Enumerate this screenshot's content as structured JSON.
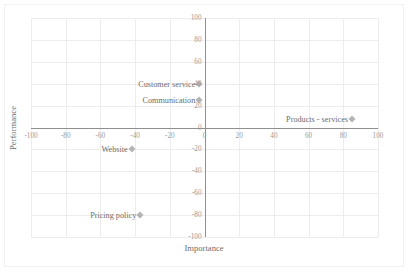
{
  "chart_data": {
    "type": "scatter",
    "title": "",
    "xlabel": "Importance",
    "ylabel": "Performance",
    "xlim": [
      -100,
      100
    ],
    "ylim": [
      -100,
      100
    ],
    "grid": true,
    "legend": "none",
    "xticks": [
      "-100",
      "-80",
      "-60",
      "-40",
      "-20",
      "0",
      "20",
      "40",
      "60",
      "80",
      "100"
    ],
    "xtickvalues": [
      -100,
      -80,
      -60,
      -40,
      -20,
      0,
      20,
      40,
      60,
      80,
      100
    ],
    "yticks": [
      "100",
      "80",
      "60",
      "40",
      "20",
      "0",
      "-20",
      "-40",
      "-60",
      "-80",
      "-100"
    ],
    "ytickvalues": [
      100,
      80,
      60,
      40,
      20,
      0,
      -20,
      -40,
      -60,
      -80,
      -100
    ],
    "marker": "diamond",
    "marker_color": "#b4b4b4",
    "points": [
      {
        "label": "Customer service",
        "x": -3,
        "y": 40,
        "label_pos": "right"
      },
      {
        "label": "Communication",
        "x": -3,
        "y": 25,
        "label_pos": "right"
      },
      {
        "label": "Products - services",
        "x": 85,
        "y": 8,
        "label_pos": "right"
      },
      {
        "label": "Website",
        "x": -42,
        "y": -20,
        "label_pos": "right"
      },
      {
        "label": "Pricing policy",
        "x": -37,
        "y": -80,
        "label_pos": "right"
      }
    ]
  },
  "colors": {
    "gridline": "#ededed",
    "axis": "#8f8f8f",
    "tick_text": "#9a9a9a",
    "label_text": "#6d6d6d",
    "border": "#f2f2f2"
  }
}
